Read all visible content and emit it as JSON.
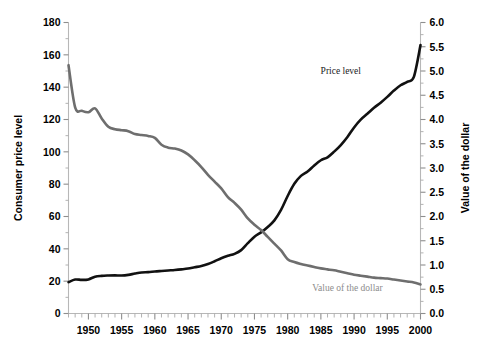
{
  "chart_data": {
    "type": "line",
    "title": "",
    "xlabel": "",
    "ylabel": "Consumer price level",
    "y2label": "Value of the dollar",
    "grid": false,
    "legend_position": "inline-annotations",
    "xlim": [
      1947,
      2000
    ],
    "ylim": [
      0,
      180
    ],
    "y2lim": [
      0.0,
      6.0
    ],
    "x_tick_labels": [
      "1950",
      "1955",
      "1960",
      "1965",
      "1970",
      "1975",
      "1980",
      "1985",
      "1990",
      "1995",
      "2000"
    ],
    "x_tick_values": [
      1950,
      1955,
      1960,
      1965,
      1970,
      1975,
      1980,
      1985,
      1990,
      1995,
      2000
    ],
    "x_minor_step": 1,
    "y_tick_labels": [
      "0",
      "20",
      "40",
      "60",
      "80",
      "100",
      "120",
      "140",
      "160",
      "180"
    ],
    "y_tick_values": [
      0,
      20,
      40,
      60,
      80,
      100,
      120,
      140,
      160,
      180
    ],
    "y_minor_step": 10,
    "y2_tick_labels": [
      "0.0",
      "0.5",
      "1.0",
      "1.5",
      "2.0",
      "2.5",
      "3.0",
      "3.5",
      "4.0",
      "4.5",
      "5.0",
      "5.5",
      "6.0"
    ],
    "y2_tick_values": [
      0.0,
      0.5,
      1.0,
      1.5,
      2.0,
      2.5,
      3.0,
      3.5,
      4.0,
      4.5,
      5.0,
      5.5,
      6.0
    ],
    "y2_minor_step": 0.25,
    "annotations": [
      {
        "text": "Price level",
        "x": 1988,
        "y_axis_value": 148,
        "color": "#1a1a1a"
      },
      {
        "text": "Value of the dollar",
        "x": 1989,
        "y_axis_value": 14,
        "color": "#8c8c8c"
      }
    ],
    "series": [
      {
        "name": "Price level",
        "axis": "left",
        "color": "#111111",
        "x": [
          1947,
          1948,
          1949,
          1950,
          1951,
          1952,
          1953,
          1954,
          1955,
          1956,
          1957,
          1958,
          1959,
          1960,
          1961,
          1962,
          1963,
          1964,
          1965,
          1966,
          1967,
          1968,
          1969,
          1970,
          1971,
          1972,
          1973,
          1974,
          1975,
          1976,
          1977,
          1978,
          1979,
          1980,
          1981,
          1982,
          1983,
          1984,
          1985,
          1986,
          1987,
          1988,
          1989,
          1990,
          1991,
          1992,
          1993,
          1994,
          1995,
          1996,
          1997,
          1998,
          1999,
          2000
        ],
        "values": [
          19.4,
          21.0,
          20.8,
          21.1,
          22.8,
          23.3,
          23.5,
          23.6,
          23.5,
          23.9,
          24.7,
          25.4,
          25.6,
          26.0,
          26.3,
          26.6,
          26.9,
          27.3,
          27.8,
          28.6,
          29.4,
          30.6,
          32.3,
          34.2,
          35.7,
          36.9,
          39.2,
          43.5,
          47.5,
          50.2,
          53.5,
          57.6,
          64.1,
          72.7,
          80.2,
          85.1,
          87.8,
          91.6,
          94.8,
          96.6,
          100.1,
          104.2,
          109.2,
          115.1,
          119.9,
          123.5,
          127.2,
          130.4,
          134.0,
          137.9,
          141.2,
          143.3,
          146.4,
          166.0
        ]
      },
      {
        "name": "Value of the dollar",
        "axis": "right",
        "color": "#6e6e6e",
        "x": [
          1947,
          1948,
          1949,
          1950,
          1951,
          1952,
          1953,
          1954,
          1955,
          1956,
          1957,
          1958,
          1959,
          1960,
          1961,
          1962,
          1963,
          1964,
          1965,
          1966,
          1967,
          1968,
          1969,
          1970,
          1971,
          1972,
          1973,
          1974,
          1975,
          1976,
          1977,
          1978,
          1979,
          1980,
          1981,
          1982,
          1983,
          1984,
          1985,
          1986,
          1987,
          1988,
          1989,
          1990,
          1991,
          1992,
          1993,
          1994,
          1995,
          1996,
          1997,
          1998,
          1999,
          2000
        ],
        "values": [
          5.12,
          4.25,
          4.18,
          4.15,
          4.23,
          4.02,
          3.85,
          3.8,
          3.78,
          3.76,
          3.7,
          3.68,
          3.66,
          3.62,
          3.48,
          3.42,
          3.4,
          3.36,
          3.28,
          3.16,
          3.02,
          2.86,
          2.72,
          2.58,
          2.4,
          2.28,
          2.14,
          1.96,
          1.83,
          1.72,
          1.58,
          1.44,
          1.3,
          1.12,
          1.06,
          1.02,
          0.99,
          0.96,
          0.93,
          0.91,
          0.89,
          0.86,
          0.83,
          0.8,
          0.78,
          0.76,
          0.74,
          0.73,
          0.72,
          0.7,
          0.68,
          0.66,
          0.64,
          0.6
        ]
      }
    ]
  }
}
